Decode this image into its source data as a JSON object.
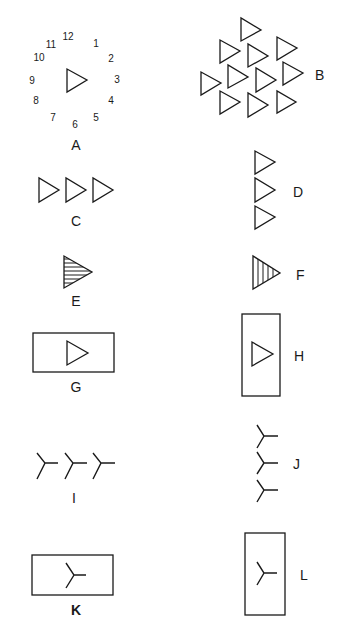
{
  "figure": {
    "colors": {
      "ink": "#1a1a1a",
      "background": "#ffffff"
    },
    "panels": [
      {
        "id": "A",
        "label": "A",
        "content": "single triangle at center of clock dial numbers 1-12"
      },
      {
        "id": "B",
        "label": "B",
        "content": "cluster of eleven outlined triangles"
      },
      {
        "id": "C",
        "label": "C",
        "content": "three triangles in a horizontal row"
      },
      {
        "id": "D",
        "label": "D",
        "content": "three triangles in a vertical column"
      },
      {
        "id": "E",
        "label": "E",
        "content": "triangle with horizontal hatching"
      },
      {
        "id": "F",
        "label": "F",
        "content": "triangle with vertical hatching"
      },
      {
        "id": "G",
        "label": "G",
        "content": "triangle inside horizontal rectangle"
      },
      {
        "id": "H",
        "label": "H",
        "content": "triangle inside vertical rectangle"
      },
      {
        "id": "I",
        "label": "I",
        "content": "three Y-marks in a horizontal row"
      },
      {
        "id": "J",
        "label": "J",
        "content": "three Y-marks in a vertical column"
      },
      {
        "id": "K",
        "label": "K",
        "content": "Y-mark inside horizontal rectangle"
      },
      {
        "id": "L",
        "label": "L",
        "content": "Y-mark inside vertical rectangle"
      }
    ],
    "clock_numbers": [
      "12",
      "1",
      "2",
      "3",
      "4",
      "5",
      "6",
      "7",
      "8",
      "9",
      "10",
      "11"
    ]
  }
}
